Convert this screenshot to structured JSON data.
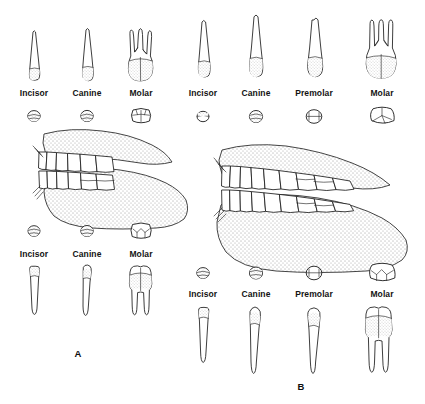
{
  "figure": {
    "background_color": "#ffffff",
    "ink_color": "#1b1b1b"
  },
  "panels": [
    {
      "id": "A",
      "marker": "A",
      "marker_x": 78,
      "marker_y": 355,
      "upper_row": {
        "caption_y": 94,
        "items": [
          {
            "label": "Incisor",
            "x": 34,
            "profile_y": 30,
            "occlusal_y": 113
          },
          {
            "label": "Canine",
            "x": 87,
            "profile_y": 30,
            "occlusal_y": 113
          },
          {
            "label": "Molar",
            "x": 141,
            "profile_y": 30,
            "occlusal_y": 113
          }
        ]
      },
      "lower_row": {
        "caption_y": 256,
        "items": [
          {
            "label": "Incisor",
            "x": 34,
            "occlusal_y": 228,
            "profile_y": 268
          },
          {
            "label": "Canine",
            "x": 87,
            "occlusal_y": 228,
            "profile_y": 268
          },
          {
            "label": "Molar",
            "x": 141,
            "occlusal_y": 228,
            "profile_y": 268
          }
        ]
      },
      "jaw": {
        "x": 30,
        "y": 128,
        "width": 165,
        "height": 100,
        "texture": "stipple"
      }
    },
    {
      "id": "B",
      "marker": "B",
      "marker_x": 301,
      "marker_y": 388,
      "upper_row": {
        "caption_y": 94,
        "items": [
          {
            "label": "Incisor",
            "x": 203,
            "profile_y": 22,
            "occlusal_y": 114
          },
          {
            "label": "Canine",
            "x": 255,
            "profile_y": 22,
            "occlusal_y": 114
          },
          {
            "label": "Premolar",
            "x": 314,
            "profile_y": 22,
            "occlusal_y": 114
          },
          {
            "label": "Molar",
            "x": 382,
            "profile_y": 22,
            "occlusal_y": 114
          }
        ]
      },
      "lower_row": {
        "caption_y": 296,
        "items": [
          {
            "label": "Incisor",
            "x": 203,
            "occlusal_y": 270,
            "profile_y": 308
          },
          {
            "label": "Canine",
            "x": 255,
            "occlusal_y": 270,
            "profile_y": 308
          },
          {
            "label": "Premolar",
            "x": 314,
            "occlusal_y": 270,
            "profile_y": 308
          },
          {
            "label": "Molar",
            "x": 382,
            "occlusal_y": 270,
            "profile_y": 308
          }
        ]
      },
      "jaw": {
        "x": 208,
        "y": 145,
        "width": 205,
        "height": 115,
        "texture": "stipple"
      }
    }
  ],
  "labels": {
    "incisor": "Incisor",
    "canine": "Canine",
    "premolar": "Premolar",
    "molar": "Molar",
    "panel_a": "A",
    "panel_b": "B"
  }
}
